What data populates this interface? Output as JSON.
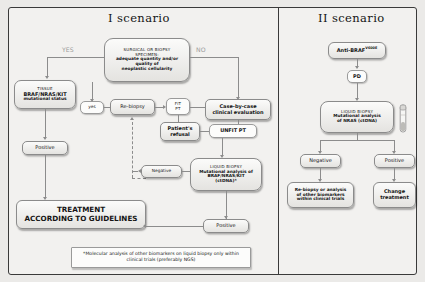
{
  "diagram": {
    "title_left": "I scenario",
    "title_right": "II scenario",
    "footnote": "*Molecular analysis of other biomarkers on liquid biopsy only within clinical trials (preferably NGS)"
  },
  "scenario1": {
    "specimen": {
      "line1": "SURGICAL OR BIOPSY",
      "line2": "SPECIMEN:",
      "line3": "adequate quantity and/or",
      "line4": "quality of",
      "line5": "neoplastic cellularity"
    },
    "label_yes": "YES",
    "label_no": "NO",
    "tissue": {
      "line1": "TISSUE",
      "line2": "BRAF/NRAS/KIT",
      "line3": "mutational status"
    },
    "positive_left": "Positive",
    "treatment": {
      "line1": "TREATMENT",
      "line2": "ACCORDING TO GUIDELINES"
    },
    "yes_small": "yes",
    "rebiopsy": "Re-biopsy",
    "fit_pt": {
      "line1": "FIT",
      "line2": "PT"
    },
    "case_by_case": {
      "line1": "Case-by-case",
      "line2": "clinical evaluation"
    },
    "patients_refusal": {
      "line1": "Patient's",
      "line2": "refusal"
    },
    "unfit_pt": "UNFIT PT",
    "liquid_biopsy": {
      "line1": "LIQUID BIOPSY",
      "line2": "Mutational analysis of",
      "line3": "BRAF/NRAS/KIT",
      "line4": "(ctDNA)*"
    },
    "negative": "Negative",
    "positive_bottom": "Positive"
  },
  "scenario2": {
    "anti_braf": "Anti-BRAF",
    "anti_braf_sup": "V600E",
    "pd": "PD",
    "liquid_biopsy": {
      "line1": "LIQUID BIOPSY",
      "line2": "Mutational analysis",
      "line3": "of NRAS (ctDNA)"
    },
    "negative": "Negative",
    "positive": "Positive",
    "rebiopsy_other": {
      "line1": "Re-biopsy or analysis",
      "line2": "of other  biomarkers",
      "line3": "within clinical trials"
    },
    "change_treatment": {
      "line1": "Change",
      "line2": "treatment"
    },
    "tube_icon": "test-tube-icon"
  },
  "colors": {
    "frame": "#3a3a3a",
    "line": "#8c8c8c",
    "text": "#141414",
    "muted": "#9d9d9d"
  }
}
